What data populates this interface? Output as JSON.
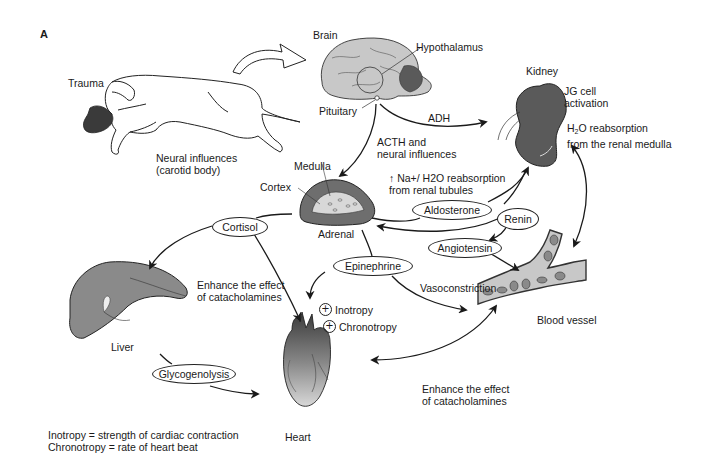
{
  "figure": {
    "panel_label": "A"
  },
  "organs": {
    "trauma": "Trauma",
    "brain": "Brain",
    "hypothalamus": "Hypothalamus",
    "pituitary": "Pituitary",
    "kidney": "Kidney",
    "medulla": "Medulla",
    "cortex": "Cortex",
    "adrenal": "Adrenal",
    "liver": "Liver",
    "heart": "Heart",
    "blood_vessel": "Blood vessel"
  },
  "hormones": {
    "cortisol": "Cortisol",
    "aldosterone": "Aldosterone",
    "renin": "Renin",
    "angiotensin": "Angiotensin",
    "epinephrine": "Epinephrine",
    "glycogenolysis": "Glycogenolysis"
  },
  "annotations": {
    "neural_influences": "Neural influences\n(carotid body)",
    "adh": "ADH",
    "acth": "ACTH and\nneural influences",
    "jg_cell": "JG cell\nactivation",
    "h2o_reabsorption_line1_pre": "H",
    "h2o_reabsorption_line1_sub": "2",
    "h2o_reabsorption_line1_post": "O reabsorption",
    "h2o_reabsorption_line2": "from the renal medulla",
    "na_reabsorption": "↑ Na+/ H2O reabsorption\nfrom renal tubules",
    "enhance_left": "Enhance the effect\nof catacholamines",
    "inotropy": "Inotropy",
    "chronotropy": "Chronotropy",
    "vasoconstriction": "Vasoconstriction",
    "enhance_bottom": "Enhance the effect\nof catacholamines"
  },
  "legend": {
    "line1": "Inotropy = strength of cardiac contraction",
    "line2": "Chronotropy = rate of heart beat"
  },
  "colors": {
    "organ_gray": "#8a8a8a",
    "organ_light": "#c8c8c8",
    "kidney": "#5a5a5a",
    "line": "#1a1a1a"
  }
}
